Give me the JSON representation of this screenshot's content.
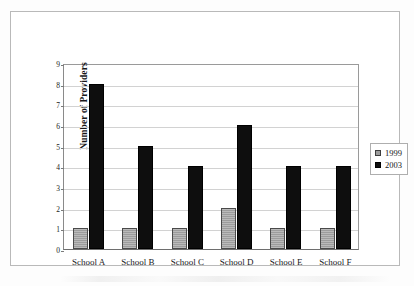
{
  "chart_data": {
    "type": "bar",
    "title": "",
    "xlabel": "",
    "ylabel": "Number of Providers",
    "ylim": [
      0,
      9
    ],
    "yticks": [
      0,
      1,
      2,
      3,
      4,
      5,
      6,
      7,
      8,
      9
    ],
    "ytick_labels": [
      "0",
      "1",
      "2",
      "3",
      "4",
      "5",
      "6",
      "7",
      "8",
      "9"
    ],
    "grid": true,
    "legend_position": "right",
    "categories": [
      "School A",
      "School B",
      "School C",
      "School D",
      "School E",
      "School F"
    ],
    "series": [
      {
        "name": "1999",
        "color": "#9c9c9c",
        "values": [
          1,
          1,
          1,
          2,
          1,
          1
        ]
      },
      {
        "name": "2003",
        "color": "#0e0e0e",
        "values": [
          8,
          5,
          4,
          6,
          4,
          4
        ]
      }
    ]
  },
  "legend": {
    "items": [
      {
        "label": "1999",
        "swatch": "gray-hatch-swatch"
      },
      {
        "label": "2003",
        "swatch": "black-swatch"
      }
    ]
  }
}
